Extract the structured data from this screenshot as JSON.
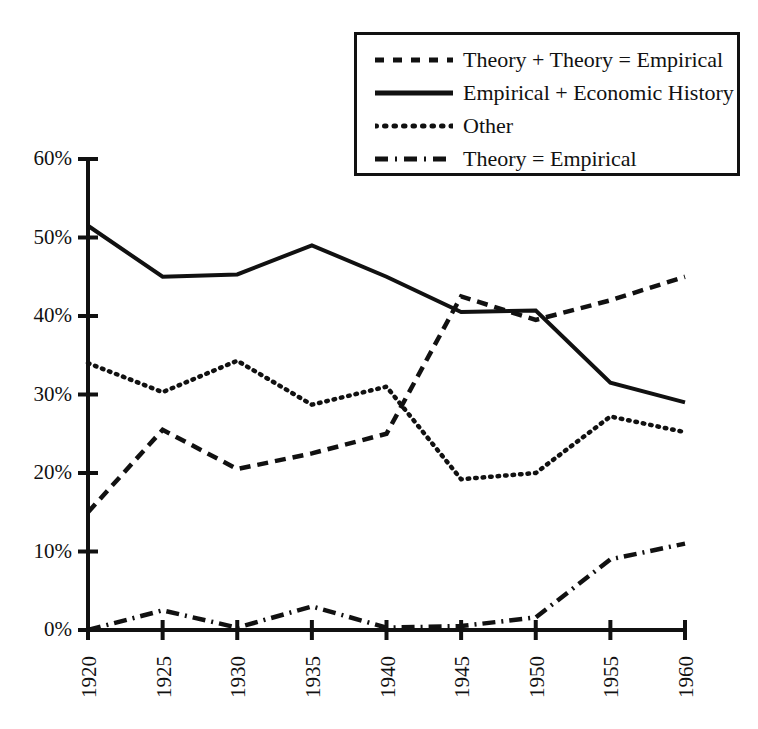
{
  "chart_data": {
    "type": "line",
    "title": "",
    "subtitle": "",
    "xlabel": "",
    "ylabel": "",
    "x": [
      1920,
      1925,
      1930,
      1935,
      1940,
      1945,
      1950,
      1955,
      1960
    ],
    "categories": [
      "1920",
      "1925",
      "1930",
      "1935",
      "1940",
      "1945",
      "1950",
      "1955",
      "1960"
    ],
    "xtick_labels": [
      "1920",
      "1925",
      "1930",
      "1935",
      "1940",
      "1945",
      "1950",
      "1955",
      "1960"
    ],
    "ytick_labels": [
      "0%",
      "10%",
      "20%",
      "30%",
      "40%",
      "50%",
      "60%"
    ],
    "ytick_values": [
      0,
      10,
      20,
      30,
      40,
      50,
      60
    ],
    "xlim": [
      1920,
      1960
    ],
    "ylim": [
      0,
      60
    ],
    "grid": false,
    "units": "percent",
    "legend_position": "top-right",
    "series": [
      {
        "name": "Theory + Theory = Empirical",
        "style": "dashed",
        "color": "#111111",
        "values": [
          15.0,
          25.5,
          20.5,
          22.5,
          25.0,
          42.5,
          39.5,
          42.0,
          45.0
        ]
      },
      {
        "name": "Empirical + Economic History",
        "style": "solid",
        "color": "#111111",
        "values": [
          51.5,
          45.0,
          45.3,
          49.0,
          45.0,
          40.5,
          40.7,
          31.5,
          29.0
        ]
      },
      {
        "name": "Other",
        "style": "dotted",
        "color": "#111111",
        "values": [
          34.0,
          30.3,
          34.3,
          28.7,
          31.0,
          19.2,
          20.0,
          27.2,
          25.2
        ]
      },
      {
        "name": "Theory = Empirical",
        "style": "dash-dot",
        "color": "#111111",
        "values": [
          0.0,
          2.5,
          0.3,
          3.0,
          0.3,
          0.5,
          1.6,
          9.0,
          11.0
        ]
      }
    ]
  },
  "legend": {
    "items": [
      {
        "label": "Theory + Theory = Empirical",
        "style": "dashed"
      },
      {
        "label": "Empirical + Economic History",
        "style": "solid"
      },
      {
        "label": "Other",
        "style": "dotted"
      },
      {
        "label": "Theory = Empirical",
        "style": "dash-dot"
      }
    ]
  }
}
